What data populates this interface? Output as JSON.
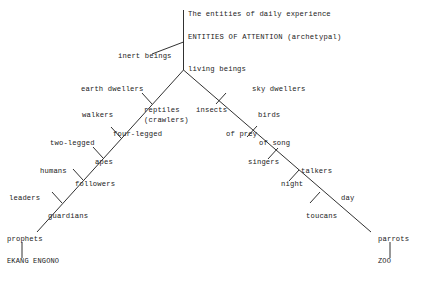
{
  "figure": {
    "type": "hierarchical-tree-diagram",
    "orientation": "inverted-v",
    "root": {
      "caption_line_1": "The entities of daily experience",
      "caption_line_2": "ENTITIES OF ATTENTION (archetypal)"
    },
    "nodes": {
      "inert_beings": "inert beings",
      "living_beings": "living beings",
      "earth_dwellers": "earth dwellers",
      "sky_dwellers": "sky dwellers",
      "walkers": "walkers",
      "reptiles_line1": "reptiles",
      "reptiles_line2": "(crawlers)",
      "insects": "insects",
      "birds": "birds",
      "two_legged": "two-legged",
      "four_legged": "four-legged",
      "of_prey": "of prey",
      "of_song": "of song",
      "humans": "humans",
      "apes": "apes",
      "singers": "singers",
      "talkers": "talkers",
      "leaders": "leaders",
      "followers": "followers",
      "night": "night",
      "day": "day",
      "prophets": "prophets",
      "guardians": "guardians",
      "toucans": "toucans",
      "parrots": "parrots",
      "terminal_left": "EKANG ENGONO",
      "terminal_right": "ZOO"
    },
    "colors": {
      "ink": "#1a1a1a",
      "background": "#ffffff"
    }
  }
}
